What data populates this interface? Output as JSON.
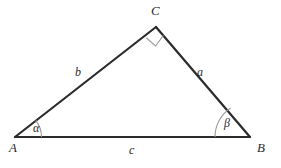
{
  "figure": {
    "type": "right-triangle-geometry-diagram",
    "background_color": "#ffffff",
    "stroke_color": "#2b2b2b",
    "arc_color": "#8a8a8a",
    "vertices": [
      {
        "name": "A",
        "label": "A",
        "x": 15,
        "y": 137
      },
      {
        "name": "B",
        "label": "B",
        "x": 250,
        "y": 137
      },
      {
        "name": "C",
        "label": "C",
        "x": 156,
        "y": 27
      }
    ],
    "sides": [
      {
        "name": "a",
        "label": "a",
        "from": "C",
        "to": "B"
      },
      {
        "name": "b",
        "label": "b",
        "from": "A",
        "to": "C"
      },
      {
        "name": "c",
        "label": "c",
        "from": "A",
        "to": "B"
      }
    ],
    "angles": [
      {
        "at": "A",
        "label": "α",
        "marker": "arc"
      },
      {
        "at": "B",
        "label": "β",
        "marker": "arc"
      },
      {
        "at": "C",
        "label": "",
        "marker": "right-angle-square"
      }
    ]
  }
}
